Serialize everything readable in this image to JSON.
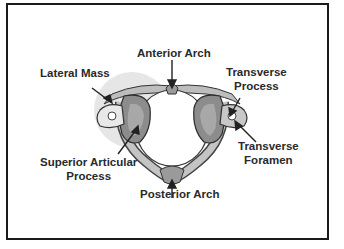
{
  "diagram": {
    "labels": {
      "anterior_arch": "Anterior Arch",
      "lateral_mass": "Lateral Mass",
      "transverse_process_line1": "Transverse",
      "transverse_process_line2": "Process",
      "transverse_foramen_line1": "Transverse",
      "transverse_foramen_line2": "Foramen",
      "superior_articular_line1": "Superior Articular",
      "superior_articular_line2": "Process",
      "posterior_arch": "Posterior Arch"
    },
    "colors": {
      "border": "#1a1a1a",
      "text": "#2a2a2a",
      "bone_fill": "#c8c8c8",
      "bone_dark": "#6e6e6e",
      "highlight_circle": "#e3e3e3"
    }
  }
}
